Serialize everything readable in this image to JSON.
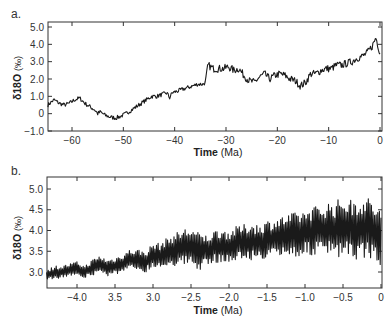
{
  "chart_data": [
    {
      "type": "line",
      "panel_label": "a.",
      "title": "",
      "xlabel": "Time",
      "xlabel_unit": "(Ma)",
      "ylabel": "δ18O",
      "ylabel_unit": "(‰)",
      "xlim": [
        -64.7,
        0
      ],
      "ylim": [
        -1.0,
        5.3
      ],
      "xticks": [
        -60,
        -50,
        -40,
        -30,
        -20,
        -10,
        0
      ],
      "xtick_labels": [
        "−60",
        "−50",
        "−40",
        "−30",
        "−20",
        "−10",
        "0"
      ],
      "yticks": [
        -1.0,
        0,
        1.0,
        2.0,
        3.0,
        4.0,
        5.0
      ],
      "ytick_labels": [
        "−1.0",
        "0",
        "1.0",
        "2.0",
        "3.0",
        "4.0",
        "5.0"
      ],
      "grid": false,
      "series": [
        {
          "name": "benthic δ18O (Cenozoic)",
          "color": "#1a1a1a",
          "x": [
            -64.7,
            -63.5,
            -62.5,
            -61.5,
            -60.5,
            -59.5,
            -58.5,
            -57.5,
            -56.5,
            -55.5,
            -55.0,
            -54.5,
            -53.5,
            -52.5,
            -51.5,
            -50.5,
            -49.5,
            -48.5,
            -47.5,
            -46.5,
            -45.5,
            -44.5,
            -43.5,
            -42.5,
            -41.5,
            -41.0,
            -40.5,
            -39.5,
            -38.5,
            -37.5,
            -36.5,
            -35.5,
            -34.5,
            -34.0,
            -33.7,
            -33.5,
            -32.5,
            -31.5,
            -30.5,
            -29.5,
            -28.5,
            -27.5,
            -26.5,
            -25.5,
            -24.5,
            -23.5,
            -22.5,
            -21.5,
            -20.5,
            -19.5,
            -18.5,
            -17.5,
            -16.5,
            -15.5,
            -14.5,
            -13.5,
            -12.5,
            -11.5,
            -10.5,
            -9.5,
            -8.5,
            -7.5,
            -6.5,
            -5.5,
            -4.5,
            -3.5,
            -2.5,
            -1.5,
            -0.8,
            0
          ],
          "values": [
            0.5,
            0.8,
            0.6,
            0.5,
            0.6,
            0.8,
            0.9,
            0.6,
            0.4,
            0.2,
            0.0,
            0.1,
            -0.1,
            -0.2,
            -0.25,
            -0.15,
            0.0,
            0.2,
            0.4,
            0.6,
            0.8,
            1.0,
            1.0,
            1.1,
            1.2,
            0.9,
            1.2,
            1.3,
            1.4,
            1.5,
            1.6,
            1.7,
            1.7,
            1.8,
            2.4,
            2.8,
            2.6,
            2.6,
            2.6,
            2.7,
            2.5,
            2.6,
            2.2,
            1.9,
            1.8,
            2.1,
            2.3,
            2.0,
            2.2,
            2.3,
            2.2,
            2.0,
            1.9,
            1.6,
            1.8,
            2.3,
            2.3,
            2.5,
            2.6,
            2.6,
            2.8,
            2.8,
            2.9,
            3.0,
            3.2,
            3.3,
            3.5,
            3.9,
            4.4,
            3.5
          ]
        }
      ]
    },
    {
      "type": "line",
      "panel_label": "b.",
      "title": "",
      "xlabel": "Time",
      "xlabel_unit": "(Ma)",
      "ylabel": "δ18O",
      "ylabel_unit": "(‰)",
      "xlim": [
        -4.4,
        0
      ],
      "ylim": [
        2.6,
        5.25
      ],
      "xticks": [
        -4.0,
        -3.5,
        -3.0,
        -2.5,
        -2.0,
        -1.5,
        -1.0,
        -0.5,
        0
      ],
      "xtick_labels": [
        "−4.0",
        "3.5",
        "3.0",
        "−2.5",
        "−2.0",
        "−1.5",
        "−1.0",
        "−0.5",
        "0"
      ],
      "yticks": [
        3.0,
        3.5,
        4.0,
        4.5,
        5.0
      ],
      "ytick_labels": [
        "3.0",
        "3.5",
        "4.0",
        "4.5",
        "5.0"
      ],
      "grid": false,
      "series": [
        {
          "name": "benthic δ18O (Plio-Pleistocene)",
          "color": "#1a1a1a",
          "x": [
            -4.4,
            -4.3,
            -4.2,
            -4.1,
            -4.0,
            -3.9,
            -3.8,
            -3.7,
            -3.6,
            -3.5,
            -3.4,
            -3.3,
            -3.2,
            -3.1,
            -3.0,
            -2.9,
            -2.8,
            -2.7,
            -2.6,
            -2.5,
            -2.4,
            -2.3,
            -2.2,
            -2.1,
            -2.0,
            -1.9,
            -1.8,
            -1.7,
            -1.6,
            -1.5,
            -1.4,
            -1.3,
            -1.2,
            -1.1,
            -1.0,
            -0.9,
            -0.8,
            -0.7,
            -0.6,
            -0.5,
            -0.4,
            -0.3,
            -0.2,
            -0.1,
            0
          ],
          "values": [
            2.9,
            3.0,
            3.0,
            3.05,
            3.1,
            3.0,
            3.1,
            3.2,
            3.1,
            3.15,
            3.2,
            3.3,
            3.3,
            3.25,
            3.4,
            3.4,
            3.5,
            3.55,
            3.6,
            3.6,
            3.5,
            3.5,
            3.6,
            3.65,
            3.6,
            3.7,
            3.7,
            3.75,
            3.7,
            3.8,
            3.8,
            3.85,
            3.9,
            3.9,
            3.95,
            4.0,
            4.0,
            4.05,
            4.0,
            4.1,
            4.0,
            4.05,
            4.1,
            4.0,
            3.8
          ],
          "oscillation_amplitude": [
            0.15,
            0.15,
            0.15,
            0.15,
            0.15,
            0.15,
            0.2,
            0.2,
            0.2,
            0.2,
            0.25,
            0.25,
            0.25,
            0.25,
            0.3,
            0.3,
            0.35,
            0.4,
            0.45,
            0.5,
            0.45,
            0.4,
            0.4,
            0.4,
            0.4,
            0.4,
            0.45,
            0.45,
            0.45,
            0.45,
            0.5,
            0.5,
            0.5,
            0.55,
            0.55,
            0.6,
            0.6,
            0.65,
            0.7,
            0.75,
            0.75,
            0.75,
            0.75,
            0.7,
            0.7
          ]
        }
      ]
    }
  ]
}
